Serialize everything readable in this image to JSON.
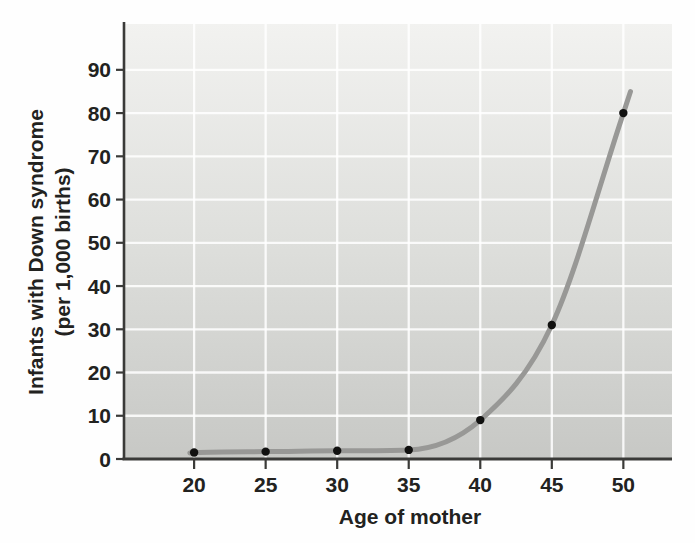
{
  "figure": {
    "xlabel": "Age of mother",
    "ylabel_line1": "Infants with Down syndrome",
    "ylabel_line2": "(per 1,000 births)"
  },
  "chart_data": {
    "type": "line",
    "title": "",
    "xlabel": "Age of mother",
    "ylabel": "Infants with Down syndrome (per 1,000 births)",
    "x": [
      20,
      25,
      30,
      35,
      40,
      45,
      50
    ],
    "values": [
      1.5,
      1.7,
      1.9,
      2.1,
      9,
      31,
      80
    ],
    "curve_start": {
      "x": 19.7,
      "y": 1.4
    },
    "curve_end": {
      "x": 50.5,
      "y": 85
    },
    "x_ticks": [
      20,
      25,
      30,
      35,
      40,
      45,
      50
    ],
    "y_ticks": [
      0,
      10,
      20,
      30,
      40,
      50,
      60,
      70,
      80,
      90
    ],
    "xlim": [
      15.1,
      53.4
    ],
    "ylim": [
      0,
      100.6
    ],
    "grid": true,
    "legend": false,
    "markers": "black-dots",
    "colors": {
      "line": "#989896",
      "marker": "#111110",
      "plot_bg_top": "#f2f2f0",
      "plot_bg_mid": "#dedfdc",
      "plot_bg_bottom": "#c7c8c5",
      "gridline": "#ffffff",
      "axis": "#3a3a38",
      "text": "#222220",
      "page_bg": "#fefefe"
    }
  }
}
